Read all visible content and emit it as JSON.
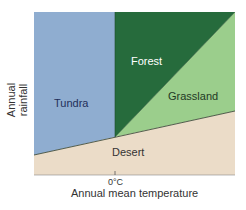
{
  "diagram": {
    "regions": [
      {
        "name": "Tundra",
        "color": "#8fadd0",
        "label_color": "#1f2f5a"
      },
      {
        "name": "Forest",
        "color": "#266b3c",
        "label_color": "#ffffff"
      },
      {
        "name": "Grassland",
        "color": "#9bce8c",
        "label_color": "#1f3a25"
      },
      {
        "name": "Desert",
        "color": "#ebdcc8",
        "label_color": "#333333"
      }
    ],
    "x_axis": {
      "label": "Annual mean temperature",
      "tick": "0°C"
    },
    "y_axis": {
      "label": "Annual rainfall"
    }
  }
}
